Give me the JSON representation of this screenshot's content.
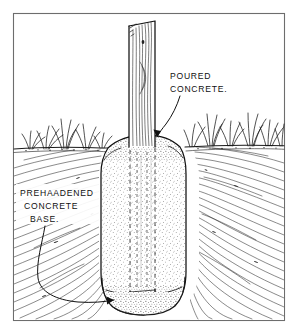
{
  "figure": {
    "style": "hand-drawn pen-and-ink line illustration",
    "background_color": "#ffffff",
    "ink_color": "#111111",
    "frame": {
      "name": "border-frame",
      "stroke_color": "#6d6d6d",
      "inset_px": 13
    }
  },
  "labels": [
    {
      "id": "poured-concrete",
      "lines": [
        "POURED",
        "CONCRETE."
      ],
      "x": 170,
      "y": 79,
      "line_height": 13,
      "leader_target": "concrete collar, upper right",
      "arrow": "down"
    },
    {
      "id": "prehardened-concrete-base",
      "lines": [
        "PREHAADENED",
        "CONCRETE",
        "BASE."
      ],
      "x": 20,
      "y": 196,
      "line_height": 13,
      "leader_target": "rounded base of hole, lower left",
      "arrow": "right"
    }
  ],
  "components": {
    "post": {
      "name": "wooden-post",
      "description": "vertical timber post with wood grain, angled cut top",
      "top_y": 21,
      "width_px": 22
    },
    "concrete": {
      "name": "poured-concrete-column",
      "description": "stippled concrete column flaring to a collar at grade",
      "texture": "stipple"
    },
    "ground_line": {
      "name": "ground-surface-line",
      "description": "horizontal grade line with grass tufts"
    },
    "soil": {
      "name": "soil-mass",
      "description": "diagonal and curved hatching representing earth in section"
    },
    "hidden_post": {
      "name": "buried-post-hidden-lines",
      "description": "vertical dashed lines indicating the post below grade"
    },
    "base": {
      "name": "prehardened-concrete-base",
      "description": "rounded bottom pad of the excavation"
    },
    "grass": {
      "name": "grass-tufts",
      "left_tufts": 4,
      "right_tufts": 6
    }
  }
}
